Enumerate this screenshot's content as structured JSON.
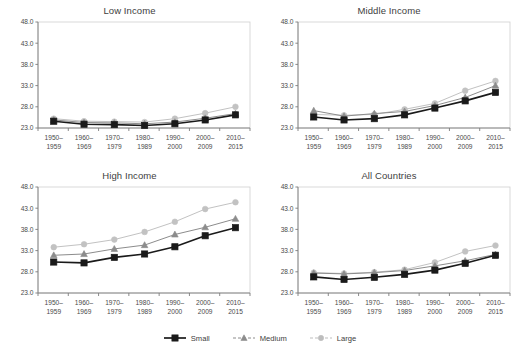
{
  "figure": {
    "panel_order": [
      "low_income",
      "middle_income",
      "high_income",
      "all_countries"
    ]
  },
  "legend": {
    "position": "bottom-center",
    "items": [
      {
        "label": "Small",
        "marker": "filled-square-icon",
        "color": "#1a1a1a"
      },
      {
        "label": "Medium",
        "marker": "triangle-icon",
        "color": "#8c8c8c"
      },
      {
        "label": "Large",
        "marker": "circle-icon",
        "color": "#bdbdbd"
      }
    ]
  },
  "axis": {
    "ylim": [
      23.0,
      48.0
    ],
    "yticks": [
      "23.0",
      "28.0",
      "33.0",
      "38.0",
      "43.0",
      "48.0"
    ],
    "ytick_values": [
      23.0,
      28.0,
      33.0,
      38.0,
      43.0,
      48.0
    ],
    "categories": [
      [
        "1950–",
        "1959"
      ],
      [
        "1960–",
        "1969"
      ],
      [
        "1970–",
        "1979"
      ],
      [
        "1980–",
        "1989"
      ],
      [
        "1990–",
        "2000"
      ],
      [
        "2000–",
        "2009"
      ],
      [
        "2010–",
        "2015"
      ]
    ],
    "grid": false
  },
  "colors": {
    "small": "#1a1a1a",
    "medium": "#8c8c8c",
    "large": "#c2c2c2",
    "frame": "#cfcfcf",
    "text": "#4a4a4a"
  },
  "chart_data": [
    {
      "id": "low_income",
      "type": "line",
      "title": "Low Income",
      "xlabel": "",
      "ylabel": "",
      "ylim": [
        23.0,
        48.0
      ],
      "categories": [
        "1950–1959",
        "1960–1969",
        "1970–1979",
        "1980–1989",
        "1990–2000",
        "2000–2009",
        "2010–2015"
      ],
      "series": [
        {
          "name": "Small",
          "values": [
            24.6,
            23.9,
            23.8,
            23.6,
            24.0,
            24.9,
            26.1
          ]
        },
        {
          "name": "Medium",
          "values": [
            24.9,
            24.3,
            24.2,
            24.0,
            24.4,
            25.3,
            26.4
          ]
        },
        {
          "name": "Large",
          "values": [
            25.2,
            24.6,
            24.5,
            24.4,
            25.2,
            26.5,
            28.0
          ]
        }
      ]
    },
    {
      "id": "middle_income",
      "type": "line",
      "title": "Middle Income",
      "xlabel": "",
      "ylabel": "",
      "ylim": [
        23.0,
        48.0
      ],
      "categories": [
        "1950–1959",
        "1960–1969",
        "1970–1979",
        "1980–1989",
        "1990–2000",
        "2000–2009",
        "2010–2015"
      ],
      "series": [
        {
          "name": "Small",
          "values": [
            25.6,
            24.9,
            25.2,
            26.1,
            27.7,
            29.4,
            31.4
          ]
        },
        {
          "name": "Medium",
          "values": [
            27.1,
            25.8,
            26.4,
            26.9,
            28.3,
            30.2,
            33.0
          ]
        },
        {
          "name": "Large",
          "values": [
            26.2,
            26.0,
            26.2,
            27.4,
            28.8,
            31.8,
            34.1
          ]
        }
      ]
    },
    {
      "id": "high_income",
      "type": "line",
      "title": "High Income",
      "xlabel": "",
      "ylabel": "",
      "ylim": [
        23.0,
        48.0
      ],
      "categories": [
        "1950–1959",
        "1960–1969",
        "1970–1979",
        "1980–1989",
        "1990–2000",
        "2000–2009",
        "2010–2015"
      ],
      "series": [
        {
          "name": "Small",
          "values": [
            30.3,
            30.1,
            31.4,
            32.2,
            33.9,
            36.5,
            38.4
          ]
        },
        {
          "name": "Medium",
          "values": [
            31.9,
            32.2,
            33.4,
            34.3,
            36.8,
            38.5,
            40.5
          ]
        },
        {
          "name": "Large",
          "values": [
            33.8,
            34.5,
            35.6,
            37.4,
            39.8,
            42.8,
            44.4
          ]
        }
      ]
    },
    {
      "id": "all_countries",
      "type": "line",
      "title": "All Countries",
      "xlabel": "",
      "ylabel": "",
      "ylim": [
        23.0,
        48.0
      ],
      "categories": [
        "1950–1959",
        "1960–1969",
        "1970–1979",
        "1980–1989",
        "1990–2000",
        "2000–2009",
        "2010–2015"
      ],
      "series": [
        {
          "name": "Small",
          "values": [
            26.8,
            26.2,
            26.7,
            27.4,
            28.4,
            30.0,
            31.9
          ]
        },
        {
          "name": "Medium",
          "values": [
            27.7,
            27.5,
            27.8,
            28.3,
            29.4,
            30.6,
            32.1
          ]
        },
        {
          "name": "Large",
          "values": [
            27.8,
            27.6,
            27.9,
            28.5,
            30.2,
            32.8,
            34.2
          ]
        }
      ]
    }
  ]
}
